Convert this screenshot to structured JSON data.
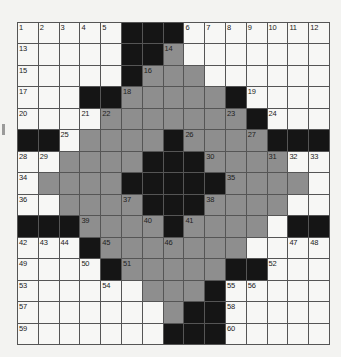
{
  "puzzle": {
    "size": {
      "rows": 15,
      "cols": 15
    },
    "colors": {
      "white": "#f7f7f5",
      "gray": "#8e8e8e",
      "black": "#151515",
      "gridline": "#555555"
    },
    "legend": {
      "W": "white cell",
      "G": "shaded cell",
      "B": "black square"
    },
    "rows": [
      "WWWWWBBBWWWWWWW",
      "WWWWWBBGWWWWWWW",
      "WWWWWBGGGWWWWWW",
      "WWWBBGGGGGBWWWW",
      "WWWWGGGGGGGBWWW",
      "BBWGGGGBGGGGBBB",
      "WWGGGGBBBGGGGWW",
      "WGGGGBBBBBGGGGW",
      "WWGGGGBBBGGGGWW",
      "BBBGGGGBGGGGWBB",
      "WWWBGGGGGGGWWWW",
      "WWWWBGGGGGBBWWW",
      "WWWWWWGGGBWWWWW",
      "WWWWWWWGBBWWWWW",
      "WWWWWWWBBBWWWWW"
    ],
    "numbers": [
      {
        "r": 0,
        "c": 0,
        "n": "1"
      },
      {
        "r": 0,
        "c": 1,
        "n": "2"
      },
      {
        "r": 0,
        "c": 2,
        "n": "3"
      },
      {
        "r": 0,
        "c": 3,
        "n": "4"
      },
      {
        "r": 0,
        "c": 4,
        "n": "5"
      },
      {
        "r": 0,
        "c": 8,
        "n": "6"
      },
      {
        "r": 0,
        "c": 9,
        "n": "7"
      },
      {
        "r": 0,
        "c": 10,
        "n": "8"
      },
      {
        "r": 0,
        "c": 11,
        "n": "9"
      },
      {
        "r": 0,
        "c": 12,
        "n": "10"
      },
      {
        "r": 0,
        "c": 13,
        "n": "11"
      },
      {
        "r": 0,
        "c": 14,
        "n": "12"
      },
      {
        "r": 1,
        "c": 0,
        "n": "13"
      },
      {
        "r": 1,
        "c": 7,
        "n": "14"
      },
      {
        "r": 2,
        "c": 0,
        "n": "15"
      },
      {
        "r": 2,
        "c": 6,
        "n": "16"
      },
      {
        "r": 3,
        "c": 0,
        "n": "17"
      },
      {
        "r": 3,
        "c": 5,
        "n": "18"
      },
      {
        "r": 3,
        "c": 11,
        "n": "19"
      },
      {
        "r": 4,
        "c": 0,
        "n": "20"
      },
      {
        "r": 4,
        "c": 3,
        "n": "21"
      },
      {
        "r": 4,
        "c": 4,
        "n": "22"
      },
      {
        "r": 4,
        "c": 10,
        "n": "23"
      },
      {
        "r": 4,
        "c": 12,
        "n": "24"
      },
      {
        "r": 5,
        "c": 2,
        "n": "25"
      },
      {
        "r": 5,
        "c": 8,
        "n": "26"
      },
      {
        "r": 5,
        "c": 11,
        "n": "27"
      },
      {
        "r": 6,
        "c": 0,
        "n": "28"
      },
      {
        "r": 6,
        "c": 1,
        "n": "29"
      },
      {
        "r": 6,
        "c": 9,
        "n": "30"
      },
      {
        "r": 6,
        "c": 12,
        "n": "31"
      },
      {
        "r": 6,
        "c": 13,
        "n": "32"
      },
      {
        "r": 6,
        "c": 14,
        "n": "33"
      },
      {
        "r": 7,
        "c": 0,
        "n": "34"
      },
      {
        "r": 7,
        "c": 10,
        "n": "35"
      },
      {
        "r": 8,
        "c": 0,
        "n": "36"
      },
      {
        "r": 8,
        "c": 5,
        "n": "37"
      },
      {
        "r": 8,
        "c": 9,
        "n": "38"
      },
      {
        "r": 9,
        "c": 3,
        "n": "39"
      },
      {
        "r": 9,
        "c": 6,
        "n": "40"
      },
      {
        "r": 9,
        "c": 8,
        "n": "41"
      },
      {
        "r": 10,
        "c": 0,
        "n": "42"
      },
      {
        "r": 10,
        "c": 1,
        "n": "43"
      },
      {
        "r": 10,
        "c": 2,
        "n": "44"
      },
      {
        "r": 10,
        "c": 4,
        "n": "45"
      },
      {
        "r": 10,
        "c": 7,
        "n": "46"
      },
      {
        "r": 10,
        "c": 13,
        "n": "47"
      },
      {
        "r": 10,
        "c": 14,
        "n": "48"
      },
      {
        "r": 11,
        "c": 0,
        "n": "49"
      },
      {
        "r": 11,
        "c": 3,
        "n": "50"
      },
      {
        "r": 11,
        "c": 5,
        "n": "51"
      },
      {
        "r": 11,
        "c": 12,
        "n": "52"
      },
      {
        "r": 12,
        "c": 0,
        "n": "53"
      },
      {
        "r": 12,
        "c": 4,
        "n": "54"
      },
      {
        "r": 12,
        "c": 10,
        "n": "55"
      },
      {
        "r": 12,
        "c": 11,
        "n": "56"
      },
      {
        "r": 13,
        "c": 0,
        "n": "57"
      },
      {
        "r": 13,
        "c": 10,
        "n": "58"
      },
      {
        "r": 14,
        "c": 0,
        "n": "59"
      },
      {
        "r": 14,
        "c": 10,
        "n": "60"
      }
    ]
  }
}
